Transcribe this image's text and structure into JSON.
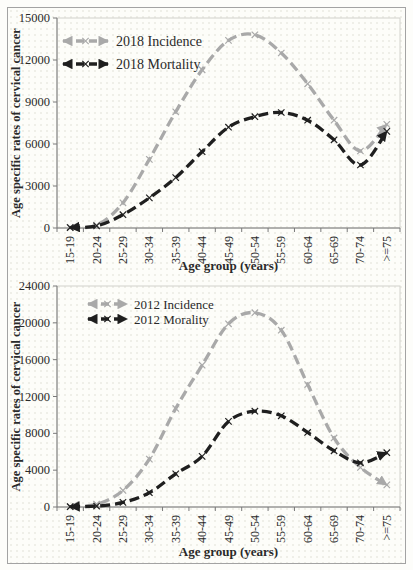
{
  "figure": {
    "background": "#fdfdf9",
    "frame_border_color": "#a3a3a3",
    "axis_color": "#7a7a7a",
    "plot_border_color": "#d2d2cc",
    "text_color": "#2a2a2a"
  },
  "chart_data": [
    {
      "type": "line",
      "panel": "top",
      "categories": [
        "15-19",
        "20-24",
        "25-29",
        "30-34",
        "35-39",
        "40-44",
        "45-49",
        "50-54",
        "55-59",
        "60-64",
        "65-69",
        "70-74",
        ">=75"
      ],
      "series": [
        {
          "name": "2018 Incidence",
          "color": "#a9a9a9",
          "marker": "x",
          "line_style": "dashed-arrow",
          "values": [
            50,
            200,
            1800,
            4900,
            8300,
            11300,
            13400,
            13800,
            12500,
            10300,
            7700,
            5500,
            7400
          ]
        },
        {
          "name": "2018 Mortality",
          "color": "#1f1f1f",
          "marker": "x",
          "line_style": "dashed-arrow",
          "values": [
            30,
            150,
            950,
            2150,
            3600,
            5450,
            7200,
            7950,
            8250,
            7700,
            6300,
            4500,
            6900
          ]
        }
      ],
      "xlabel": "Age group (years)",
      "ylabel": "Age specific rates of cervical cancer",
      "ylim": [
        0,
        15000
      ],
      "yticks": [
        0,
        3000,
        6000,
        9000,
        12000,
        15000
      ],
      "legend_position": "top-left",
      "grid": false
    },
    {
      "type": "line",
      "panel": "bottom",
      "categories": [
        "15-19",
        "20-24",
        "25-29",
        "30-34",
        "35-39",
        "40-44",
        "45-49",
        "50-54",
        "55-59",
        "60-64",
        "65-69",
        "70-74",
        ">=75"
      ],
      "series": [
        {
          "name": "2012 Incidence",
          "color": "#a9a9a9",
          "marker": "x",
          "line_style": "dashed-arrow",
          "values": [
            50,
            300,
            1800,
            5200,
            10700,
            15400,
            19900,
            21100,
            19200,
            13300,
            7500,
            4300,
            2400
          ]
        },
        {
          "name": "2012 Morality",
          "color": "#1f1f1f",
          "marker": "x",
          "line_style": "dashed-arrow",
          "values": [
            30,
            100,
            500,
            1550,
            3600,
            5500,
            9300,
            10400,
            9900,
            8100,
            6100,
            4800,
            5900
          ]
        }
      ],
      "xlabel": "Age group (years)",
      "ylabel": "Age specific rates of cervical cancer",
      "ylim": [
        0,
        24000
      ],
      "yticks": [
        0,
        4000,
        8000,
        12000,
        16000,
        20000,
        24000
      ],
      "legend_position": "top-left",
      "grid": false
    }
  ]
}
